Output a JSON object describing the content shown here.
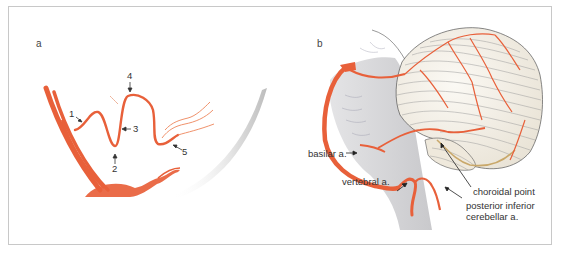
{
  "figure": {
    "colors": {
      "artery": "#e8603a",
      "artery_light": "#f0926c",
      "brainstem_gray": "#d6d6d8",
      "cerebellum_fill": "#f3efe8",
      "folia_lines": "#8a8a8a",
      "choroid_tan": "#c9a86a",
      "frame_border": "#c8c8c8",
      "label_text": "#333333"
    },
    "panel_a": {
      "letter": "a",
      "markers": [
        {
          "number": "1"
        },
        {
          "number": "2"
        },
        {
          "number": "3"
        },
        {
          "number": "4"
        },
        {
          "number": "5"
        }
      ]
    },
    "panel_b": {
      "letter": "b",
      "labels": {
        "basilar": "basilar a.",
        "vertebral": "vertebral a.",
        "choroidal_point": "choroidal point",
        "pica_line1": "posterior inferior",
        "pica_line2": "cerebellar a."
      }
    }
  }
}
